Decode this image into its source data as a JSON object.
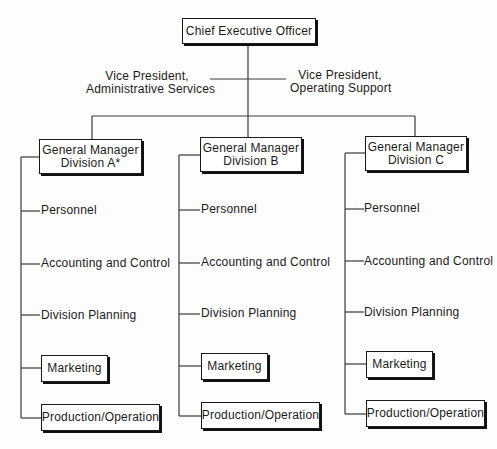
{
  "chart": {
    "ceo": "Chief Executive Officer",
    "vp_left": [
      "Vice President,",
      "Administrative Services"
    ],
    "vp_right": [
      "Vice President,",
      "Operating Support"
    ],
    "divisions": [
      {
        "title": [
          "General Manager",
          "Division A*"
        ],
        "functions": [
          "Personnel",
          "Accounting and Control",
          "Division Planning"
        ],
        "boxed_units": [
          "Marketing",
          "Production/Operation"
        ]
      },
      {
        "title": [
          "General Manager",
          "Division B"
        ],
        "functions": [
          "Personnel",
          "Accounting and Control",
          "Division Planning"
        ],
        "boxed_units": [
          "Marketing",
          "Production/Operation"
        ]
      },
      {
        "title": [
          "General Manager",
          "Division C"
        ],
        "functions": [
          "Personnel",
          "Accounting and Control",
          "Division Planning"
        ],
        "boxed_units": [
          "Marketing",
          "Production/Operation"
        ]
      }
    ]
  }
}
